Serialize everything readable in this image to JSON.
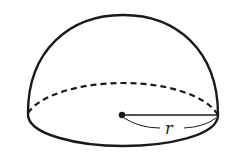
{
  "diagram": {
    "shape": "hemisphere",
    "radius_label": "r",
    "colors": {
      "stroke": "#1a1a1a",
      "background": "#ffffff"
    }
  }
}
